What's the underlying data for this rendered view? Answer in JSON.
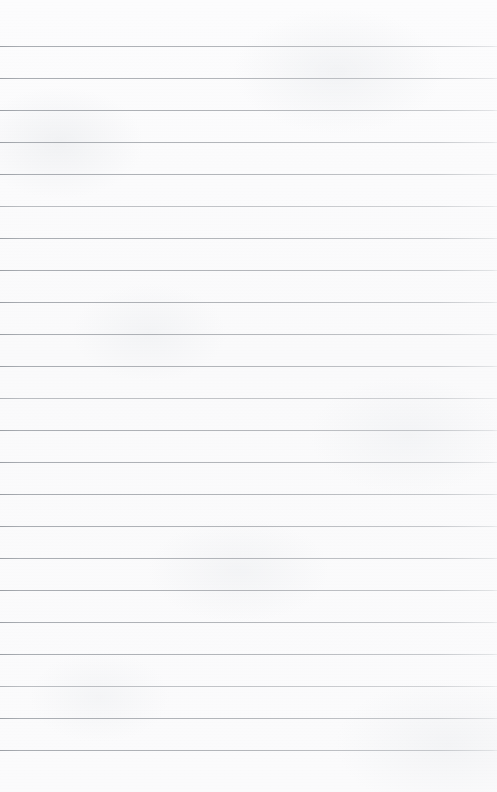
{
  "page": {
    "kind": "lined-paper",
    "width": 497,
    "height": 792,
    "text_content": "",
    "background_color": "#fbfbfc",
    "rule_color": "#a8abb0",
    "rule_thickness": 1,
    "first_rule_y": 46,
    "rule_spacing": 32,
    "rule_count": 23,
    "rule_inset_left": 0,
    "rule_inset_right": 0,
    "top_margin_height": 46,
    "bottom_margin_height": 42,
    "has_margin_rule": false,
    "has_holes": false,
    "rules_y": [
      46,
      78,
      110,
      142,
      174,
      206,
      238,
      270,
      302,
      334,
      366,
      398,
      430,
      462,
      494,
      526,
      558,
      590,
      622,
      654,
      686,
      718,
      750
    ],
    "faint_rule_indices": [
      5,
      11,
      20
    ]
  }
}
